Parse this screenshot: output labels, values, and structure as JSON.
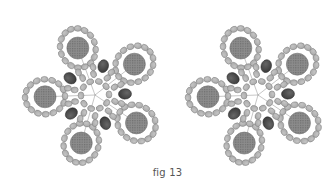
{
  "figure": {
    "caption": "fig 13",
    "colors": {
      "background": "#ffffff",
      "seed_bead": "#a8a8a8",
      "seed_bead_stroke": "#7a7a7a",
      "accent_bead": "#3a3a3a",
      "large_bead": "#8c8c8c",
      "thread": "#444444"
    },
    "motifs": [
      {
        "name": "left-star-motif",
        "center": [
          95,
          95
        ],
        "rotation": 0
      },
      {
        "name": "right-star-motif",
        "center": [
          258,
          95
        ],
        "rotation": 0
      }
    ],
    "structure": {
      "points": 5,
      "large_bead_radius": 11,
      "large_bead_distance": 50,
      "accent_bead_count": 5,
      "accent_bead_distance": 30,
      "inner_ring_beads": 10,
      "inner_ring_radius": 14
    }
  }
}
